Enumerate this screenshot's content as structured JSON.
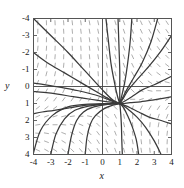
{
  "figure": {
    "name": "direction-field-phase-portrait",
    "background_color": "#ffffff",
    "frame_color": "#555555",
    "axis_line_color": "#444444",
    "slope_mark_color": "#999999",
    "trajectory_color": "#3a3a3a"
  },
  "axes": {
    "x_title": "x",
    "y_title": "y",
    "x_ticks": [
      "-4",
      "-3",
      "-2",
      "-1",
      "0",
      "1",
      "2",
      "3",
      "4"
    ],
    "y_ticks": [
      "4",
      "3",
      "2",
      "1",
      "0",
      "-1",
      "-2",
      "-3",
      "-4"
    ]
  },
  "chart_data": {
    "type": "line",
    "title": "",
    "xlabel": "x",
    "ylabel": "y",
    "xlim": [
      -4,
      4
    ],
    "ylim": [
      -4,
      4
    ],
    "grid": false,
    "legend": "none",
    "x_ticks": [
      -4,
      -3,
      -2,
      -1,
      0,
      1,
      2,
      3,
      4
    ],
    "y_ticks": [
      -4,
      -3,
      -2,
      -1,
      0,
      1,
      2,
      3,
      4
    ],
    "critical_point": [
      1,
      -1
    ],
    "slope_field": {
      "description": "short dash segments on a grid showing direction of dy/dx",
      "x_start": -3.75,
      "x_step": 0.5,
      "x_count": 16,
      "y_start": -3.75,
      "y_step": 0.5,
      "y_count": 16,
      "dash_length_px": 5
    },
    "series": [
      {
        "name": "trajectory-1",
        "x": [
          -4.0,
          -3.0,
          -2.0,
          -1.0,
          0.0,
          0.6,
          1.0
        ],
        "y": [
          4.0,
          3.0,
          2.0,
          0.9,
          -0.2,
          -0.8,
          -1.0
        ]
      },
      {
        "name": "trajectory-2",
        "x": [
          -4.0,
          -3.2,
          -2.2,
          -1.2,
          -0.2,
          0.5,
          1.0
        ],
        "y": [
          2.0,
          1.4,
          0.8,
          0.2,
          -0.4,
          -0.8,
          -1.0
        ]
      },
      {
        "name": "trajectory-3",
        "x": [
          -4.0,
          -3.3,
          -2.4,
          -1.4,
          -0.4,
          0.4,
          1.0
        ],
        "y": [
          0.2,
          0.1,
          -0.05,
          -0.25,
          -0.5,
          -0.8,
          -1.0
        ]
      },
      {
        "name": "trajectory-4",
        "x": [
          -4.0,
          -3.4,
          -2.6,
          -1.7,
          -0.7,
          0.3,
          1.0
        ],
        "y": [
          -0.3,
          -0.35,
          -0.45,
          -0.6,
          -0.75,
          -0.9,
          -1.0
        ]
      },
      {
        "name": "trajectory-5",
        "x": [
          -4.0,
          -3.6,
          -2.9,
          -2.0,
          -1.0,
          0.2,
          1.0
        ],
        "y": [
          -3.9,
          -2.6,
          -1.7,
          -1.2,
          -1.05,
          -1.0,
          -1.0
        ]
      },
      {
        "name": "trajectory-6",
        "x": [
          -3.0,
          -2.7,
          -2.2,
          -1.6,
          -0.8,
          0.2,
          1.0
        ],
        "y": [
          -4.0,
          -2.8,
          -1.9,
          -1.4,
          -1.15,
          -1.03,
          -1.0
        ]
      },
      {
        "name": "trajectory-7",
        "x": [
          -2.0,
          -1.8,
          -1.5,
          -1.1,
          -0.5,
          0.3,
          1.0
        ],
        "y": [
          -4.0,
          -2.9,
          -2.0,
          -1.5,
          -1.2,
          -1.05,
          -1.0
        ]
      },
      {
        "name": "trajectory-8",
        "x": [
          -1.0,
          -0.9,
          -0.7,
          -0.4,
          0.1,
          0.6,
          1.0
        ],
        "y": [
          -4.0,
          -3.0,
          -2.2,
          -1.7,
          -1.3,
          -1.1,
          -1.0
        ]
      },
      {
        "name": "trajectory-9",
        "x": [
          0.2,
          0.35,
          0.5,
          0.7,
          0.85,
          0.95,
          1.0
        ],
        "y": [
          4.0,
          2.6,
          1.3,
          0.2,
          -0.5,
          -0.85,
          -1.0
        ]
      },
      {
        "name": "trajectory-10",
        "x": [
          0.9,
          0.95,
          1.0,
          1.0,
          1.0,
          1.0,
          1.0
        ],
        "y": [
          4.0,
          2.5,
          1.0,
          0.1,
          -0.5,
          -0.85,
          -1.0
        ]
      },
      {
        "name": "trajectory-11",
        "x": [
          1.7,
          1.6,
          1.45,
          1.3,
          1.15,
          1.05,
          1.0
        ],
        "y": [
          4.0,
          2.6,
          1.3,
          0.3,
          -0.4,
          -0.8,
          -1.0
        ]
      },
      {
        "name": "trajectory-12",
        "x": [
          3.2,
          2.8,
          2.3,
          1.8,
          1.4,
          1.15,
          1.0
        ],
        "y": [
          4.0,
          2.6,
          1.4,
          0.5,
          -0.2,
          -0.7,
          -1.0
        ]
      },
      {
        "name": "trajectory-13",
        "x": [
          4.0,
          3.4,
          2.7,
          2.0,
          1.5,
          1.2,
          1.0
        ],
        "y": [
          3.0,
          2.1,
          1.2,
          0.4,
          -0.2,
          -0.7,
          -1.0
        ]
      },
      {
        "name": "trajectory-14",
        "x": [
          4.0,
          3.6,
          3.0,
          2.3,
          1.7,
          1.3,
          1.0
        ],
        "y": [
          0.6,
          0.4,
          0.1,
          -0.2,
          -0.6,
          -0.85,
          -1.0
        ]
      },
      {
        "name": "trajectory-15",
        "x": [
          4.0,
          3.5,
          2.9,
          2.2,
          1.6,
          1.25,
          1.0
        ],
        "y": [
          -0.6,
          -0.7,
          -0.8,
          -0.9,
          -0.95,
          -1.0,
          -1.0
        ]
      },
      {
        "name": "trajectory-16",
        "x": [
          4.0,
          3.4,
          2.7,
          2.1,
          1.6,
          1.25,
          1.0
        ],
        "y": [
          -2.2,
          -2.0,
          -1.8,
          -1.5,
          -1.25,
          -1.1,
          -1.0
        ]
      },
      {
        "name": "trajectory-17",
        "x": [
          3.4,
          3.0,
          2.5,
          2.0,
          1.5,
          1.2,
          1.0
        ],
        "y": [
          -4.0,
          -3.2,
          -2.4,
          -1.8,
          -1.35,
          -1.12,
          -1.0
        ]
      },
      {
        "name": "trajectory-18",
        "x": [
          2.1,
          1.95,
          1.7,
          1.45,
          1.25,
          1.1,
          1.0
        ],
        "y": [
          -4.0,
          -3.1,
          -2.3,
          -1.7,
          -1.3,
          -1.1,
          -1.0
        ]
      },
      {
        "name": "trajectory-19",
        "x": [
          1.15,
          1.12,
          1.1,
          1.07,
          1.04,
          1.02,
          1.0
        ],
        "y": [
          -4.0,
          -3.2,
          -2.4,
          -1.8,
          -1.4,
          -1.15,
          -1.0
        ]
      },
      {
        "name": "trajectory-20",
        "x": [
          -4.0,
          -3.5,
          -2.8,
          -1.9,
          -0.9,
          0.2,
          1.0
        ],
        "y": [
          -1.6,
          -1.5,
          -1.4,
          -1.25,
          -1.1,
          -1.02,
          -1.0
        ]
      }
    ]
  }
}
